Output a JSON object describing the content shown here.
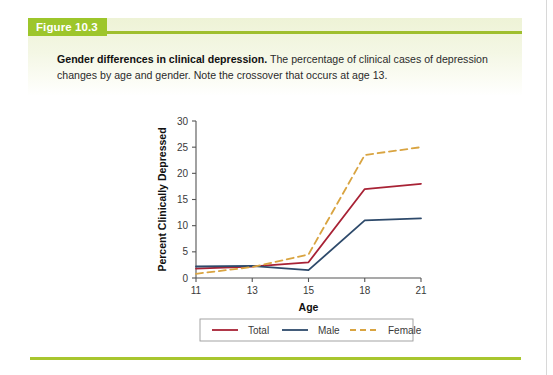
{
  "figure": {
    "tab_label": "Figure 10.3",
    "caption_lead": "Gender differences in clinical depression.",
    "caption_body": " The percentage of clinical cases of depression changes by age and gender. Note the crossover that occurs at age 13."
  },
  "colors": {
    "green_tab": "#9dc62b",
    "green_rule": "#a8c62f",
    "band_top": "#eef3d6",
    "total": "#a82235",
    "male": "#2e4a6b",
    "female": "#d9a441",
    "axis": "#555555"
  },
  "chart_data": {
    "type": "line",
    "title": "",
    "xlabel": "Age",
    "ylabel": "Percent Clinically Depressed",
    "x": [
      11,
      13,
      15,
      18,
      21
    ],
    "xtick_labels": [
      "11",
      "13",
      "15",
      "18",
      "21"
    ],
    "ytick_labels": [
      "0",
      "5",
      "10",
      "15",
      "20",
      "25",
      "30"
    ],
    "yticks": [
      0,
      5,
      10,
      15,
      20,
      25,
      30
    ],
    "ylim": [
      0,
      30
    ],
    "grid": false,
    "legend_position": "bottom",
    "series": [
      {
        "name": "Total",
        "color": "#a82235",
        "style": "solid",
        "values": [
          1.8,
          2.2,
          3.0,
          17.0,
          18.0
        ]
      },
      {
        "name": "Male",
        "color": "#2e4a6b",
        "style": "solid",
        "values": [
          2.2,
          2.3,
          1.5,
          11.0,
          11.4
        ]
      },
      {
        "name": "Female",
        "color": "#d9a441",
        "style": "dashed",
        "values": [
          0.8,
          2.1,
          4.5,
          23.5,
          25.0
        ]
      }
    ]
  }
}
